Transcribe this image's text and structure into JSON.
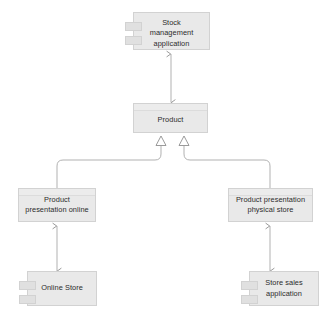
{
  "diagram": {
    "type": "uml-component-diagram",
    "background_color": "#ffffff",
    "node_fill_color": "#e9e9e9",
    "node_border_color": "#d2d2d2",
    "connector_color": "#9a9a9a",
    "text_color": "#2b2b2b",
    "nodes": [
      {
        "id": "stock-management",
        "label": "Stock\nmanagement\napplication",
        "stereotype": "component",
        "has_tabs": true
      },
      {
        "id": "product",
        "label": "Product",
        "stereotype": "component",
        "has_tabs": false
      },
      {
        "id": "presentation-online",
        "label": "Product\npresentation online",
        "stereotype": "component",
        "has_tabs": false
      },
      {
        "id": "presentation-store",
        "label": "Product presentation\nphysical store",
        "stereotype": "component",
        "has_tabs": false
      },
      {
        "id": "online-store",
        "label": "Online Store",
        "stereotype": "component",
        "has_tabs": true
      },
      {
        "id": "store-sales",
        "label": "Store sales\napplication",
        "stereotype": "component",
        "has_tabs": true
      }
    ],
    "connectors": [
      {
        "id": "product-to-stock-management",
        "from": "product",
        "to": "stock-management",
        "relationship": "dependency",
        "arrowhead": "open-arrow",
        "routing": "vertical"
      },
      {
        "id": "presentation-online-to-product",
        "from": "presentation-online",
        "to": "product",
        "relationship": "generalization",
        "arrowhead": "hollow-triangle",
        "routing": "orthogonal"
      },
      {
        "id": "presentation-store-to-product",
        "from": "presentation-store",
        "to": "product",
        "relationship": "generalization",
        "arrowhead": "hollow-triangle",
        "routing": "orthogonal"
      },
      {
        "id": "online-store-to-presentation-online",
        "from": "online-store",
        "to": "presentation-online",
        "relationship": "dependency",
        "arrowhead": "open-arrow",
        "routing": "vertical"
      },
      {
        "id": "store-sales-to-presentation-store",
        "from": "store-sales",
        "to": "presentation-store",
        "relationship": "dependency",
        "arrowhead": "open-arrow",
        "routing": "vertical"
      }
    ]
  }
}
